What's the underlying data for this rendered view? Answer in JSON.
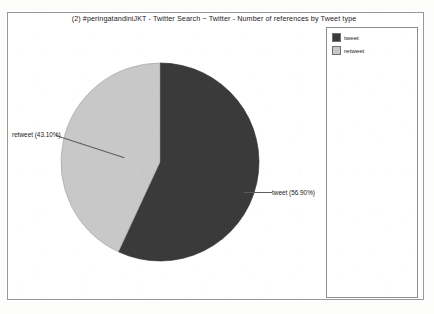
{
  "chart_data": {
    "type": "pie",
    "title": "(2) #peringatandiniJKT - Twitter Search ~ Twitter - Number of references by Tweet type",
    "categories": [
      "tweet",
      "retweet"
    ],
    "values": [
      56.9,
      43.1
    ],
    "value_unit": "%",
    "slices": [
      {
        "label": "tweet",
        "percent": 56.9,
        "callout": "tweet (56.90%)",
        "color": "#3a3a3a",
        "start_angle_deg": 0,
        "sweep_deg": 204.84
      },
      {
        "label": "retweet",
        "percent": 43.1,
        "callout": "retweet (43.10%)",
        "color": "#c8c8c8",
        "start_angle_deg": 204.84,
        "sweep_deg": 155.16
      }
    ],
    "legend": {
      "position": "right",
      "entries": [
        {
          "label": "tweet",
          "color": "#3a3a3a"
        },
        {
          "label": "retweet",
          "color": "#c8c8c8"
        }
      ]
    },
    "xlabel": "",
    "ylabel": "",
    "grid": false
  },
  "frame": {
    "border_color": "#9a9a9a",
    "background": "#ffffff"
  }
}
